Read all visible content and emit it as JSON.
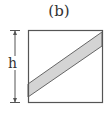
{
  "figure": {
    "label": "(b)",
    "dimension_label": "h",
    "colors": {
      "stroke": "#555555",
      "band_fill": "#d4d4d4",
      "background": "#ffffff"
    }
  }
}
